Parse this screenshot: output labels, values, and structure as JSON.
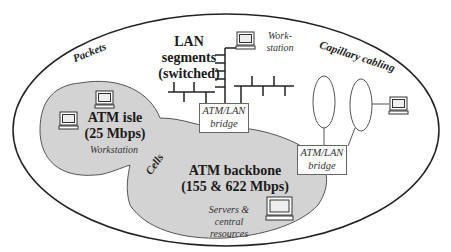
{
  "diagram": {
    "type": "network-topology",
    "regions": {
      "outer": {
        "name": "Packets domain"
      },
      "atm_isle": {
        "title": "ATM isle",
        "speed": "(25 Mbps)",
        "note": "Workstation",
        "fill": "#d3d3d3"
      },
      "atm_backbone": {
        "title": "ATM backbone",
        "speed": "(155 & 622 Mbps)",
        "note_line1": "Servers &",
        "note_line2": "central",
        "note_line3": "resources",
        "fill": "#d3d3d3"
      }
    },
    "labels": {
      "packets": "Packets",
      "cells": "Cells",
      "capillary": "Capillary cabling",
      "lan_line1": "LAN",
      "lan_line2": "segments",
      "lan_line3": "(switched)",
      "workstation_line1": "Work-",
      "workstation_line2": "station"
    },
    "bridges": [
      {
        "line1": "ATM/LAN",
        "line2": "bridge"
      },
      {
        "line1": "ATM/LAN",
        "line2": "bridge"
      }
    ],
    "colors": {
      "line": "#222222",
      "fill": "#d3d3d3",
      "background": "#ffffff"
    }
  }
}
